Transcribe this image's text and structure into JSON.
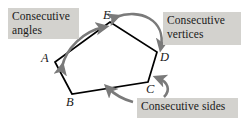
{
  "figure": {
    "background_color": "#ffffff",
    "callout_background": "#d3d2ce",
    "line_color": "#000000",
    "arrow_color": "#7a7a7a"
  },
  "callouts": {
    "angles": "Consecutive\nangles",
    "vertices": "Consecutive\nvertices",
    "sides": "Consecutive sides"
  },
  "polygon": {
    "name": "pentagon-ABCDE",
    "vertices": [
      {
        "label": "A",
        "x": 55,
        "y": 62
      },
      {
        "label": "B",
        "x": 72,
        "y": 94
      },
      {
        "label": "C",
        "x": 148,
        "y": 82
      },
      {
        "label": "D",
        "x": 157,
        "y": 52
      },
      {
        "label": "E",
        "x": 110,
        "y": 22
      }
    ]
  },
  "annotations": {
    "angles_arrow": "double-headed curved arrow from vertex A to vertex E",
    "vertices_arrow": "double-headed curved arrow from vertex E to vertex D",
    "sides_arrow": "curved arrow pointing to side BC"
  }
}
